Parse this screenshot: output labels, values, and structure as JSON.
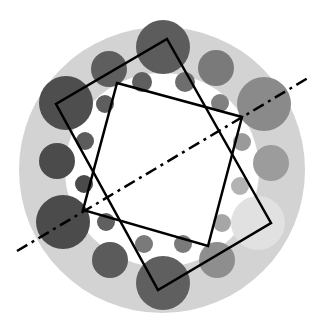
{
  "diagram": {
    "title": "",
    "background": "#ffffff",
    "ring": {
      "cx": 162,
      "cy": 170,
      "r_outer": 143,
      "r_inner": 97,
      "color": "#d3d3d3",
      "inner_color": "#ffffff"
    },
    "circles": [
      {
        "cx": 163,
        "cy": 47,
        "r": 27,
        "color": "#5c5c5c"
      },
      {
        "cx": 109,
        "cy": 69,
        "r": 18,
        "color": "#5e5e5e"
      },
      {
        "cx": 142,
        "cy": 82,
        "r": 10,
        "color": "#5f5f5f"
      },
      {
        "cx": 185,
        "cy": 82,
        "r": 10,
        "color": "#6e6e6e"
      },
      {
        "cx": 216,
        "cy": 68,
        "r": 18,
        "color": "#7a7a7a"
      },
      {
        "cx": 66,
        "cy": 103,
        "r": 27,
        "color": "#4e4e4e"
      },
      {
        "cx": 105,
        "cy": 104,
        "r": 9,
        "color": "#5e5e5e"
      },
      {
        "cx": 220,
        "cy": 103,
        "r": 9,
        "color": "#808080"
      },
      {
        "cx": 264,
        "cy": 104,
        "r": 27,
        "color": "#8a8a8a"
      },
      {
        "cx": 85,
        "cy": 141,
        "r": 9,
        "color": "#5c5c5c"
      },
      {
        "cx": 242,
        "cy": 142,
        "r": 9,
        "color": "#9a9a9a"
      },
      {
        "cx": 57,
        "cy": 161,
        "r": 18,
        "color": "#4b4b4b"
      },
      {
        "cx": 271,
        "cy": 163,
        "r": 18,
        "color": "#9c9c9c"
      },
      {
        "cx": 84,
        "cy": 184,
        "r": 9,
        "color": "#4a4a4a"
      },
      {
        "cx": 240,
        "cy": 186,
        "r": 9,
        "color": "#b3b3b3"
      },
      {
        "cx": 63,
        "cy": 222,
        "r": 27,
        "color": "#4b4b4b"
      },
      {
        "cx": 106,
        "cy": 222,
        "r": 9,
        "color": "#606060"
      },
      {
        "cx": 222,
        "cy": 223,
        "r": 9,
        "color": "#a6a6a6"
      },
      {
        "cx": 258,
        "cy": 223,
        "r": 27,
        "color": "#e1e1e1"
      },
      {
        "cx": 110,
        "cy": 260,
        "r": 18,
        "color": "#5b5b5b"
      },
      {
        "cx": 144,
        "cy": 244,
        "r": 9,
        "color": "#7a7a7a"
      },
      {
        "cx": 183,
        "cy": 244,
        "r": 9,
        "color": "#7a7a7a"
      },
      {
        "cx": 217,
        "cy": 260,
        "r": 18,
        "color": "#8e8e8e"
      },
      {
        "cx": 163,
        "cy": 283,
        "r": 27,
        "color": "#5f5f5f"
      }
    ],
    "outer_square": {
      "points": [
        [
          167,
          39
        ],
        [
          271,
          223
        ],
        [
          158,
          290
        ],
        [
          56,
          104
        ]
      ],
      "stroke": "#000000",
      "width": 2.5
    },
    "inner_square": {
      "points": [
        [
          117,
          83
        ],
        [
          242,
          117
        ],
        [
          208,
          246
        ],
        [
          83,
          210
        ]
      ],
      "stroke": "#000000",
      "width": 2.5
    },
    "axis_line": {
      "x1": 17,
      "y1": 251,
      "x2": 308,
      "y2": 78,
      "stroke": "#000000",
      "width": 2.5,
      "dash": "12 5 3 5"
    }
  }
}
